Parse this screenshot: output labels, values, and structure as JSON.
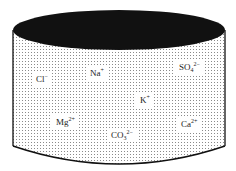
{
  "diagram": {
    "type": "cylinder-container",
    "colors": {
      "top_fill": "#111111",
      "body_stipple": "#9a9a9a",
      "outline": "#111111",
      "label_bg": "#ffffff"
    },
    "ions": [
      {
        "id": "chloride",
        "base": "Cl",
        "sub": "",
        "sup": "−",
        "x": 32,
        "y": 72
      },
      {
        "id": "sodium",
        "base": "Na",
        "sub": "",
        "sup": "+",
        "x": 86,
        "y": 66
      },
      {
        "id": "sulfate",
        "base": "SO",
        "sub": "4",
        "sup": "2−",
        "x": 175,
        "y": 60
      },
      {
        "id": "potassium",
        "base": "K",
        "sub": "",
        "sup": "+",
        "x": 136,
        "y": 93
      },
      {
        "id": "magnesium",
        "base": "Mg",
        "sub": "",
        "sup": "2+",
        "x": 52,
        "y": 115
      },
      {
        "id": "carbonate",
        "base": "CO",
        "sub": "3",
        "sup": "2−",
        "x": 107,
        "y": 128
      },
      {
        "id": "calcium",
        "base": "Ca",
        "sub": "",
        "sup": "2+",
        "x": 177,
        "y": 117
      }
    ]
  }
}
